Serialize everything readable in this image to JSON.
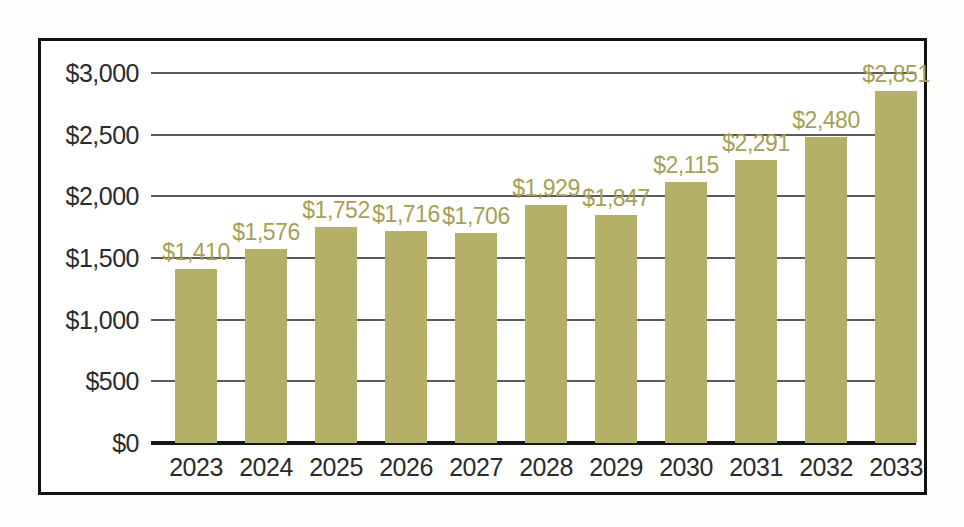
{
  "chart_data": {
    "type": "bar",
    "title": "",
    "subtitle": "",
    "xlabel": "",
    "ylabel": "",
    "categories": [
      "2023",
      "2024",
      "2025",
      "2026",
      "2027",
      "2028",
      "2029",
      "2030",
      "2031",
      "2032",
      "2033"
    ],
    "values": [
      1410,
      1576,
      1752,
      1716,
      1706,
      1929,
      1847,
      2115,
      2291,
      2480,
      2851
    ],
    "data_labels": [
      "$1,410",
      "$1,576",
      "$1,752",
      "$1,716",
      "$1,706",
      "$1,929",
      "$1,847",
      "$2,115",
      "$2,291",
      "$2,480",
      "$2,851"
    ],
    "ylim": [
      0,
      3000
    ],
    "ytick_values": [
      3000,
      2500,
      2000,
      1500,
      1000,
      500,
      0
    ],
    "ytick_labels": [
      "$3,000",
      "$2,500",
      "$2,000",
      "$1,500",
      "$1,000",
      "$500",
      "$0"
    ],
    "grid": true,
    "legend": null,
    "series": [
      {
        "name": "",
        "values": [
          1410,
          1576,
          1752,
          1716,
          1706,
          1929,
          1847,
          2115,
          2291,
          2480,
          2851
        ]
      }
    ],
    "colors": {
      "bar": "#b4b067",
      "data_label": "#a79f55",
      "gridline": "#5b5b5b",
      "axis": "#161616",
      "tick_label": "#2b2b2b",
      "frame": "#111111",
      "background": "#ffffff"
    }
  }
}
